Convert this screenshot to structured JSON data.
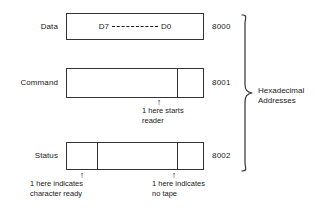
{
  "figure": {
    "rows": [
      {
        "label": "Data",
        "address": "8000",
        "bit_high": "D7",
        "bit_low": "D0",
        "separator": "dashed-line"
      },
      {
        "label": "Command",
        "address": "8001"
      },
      {
        "label": "Status",
        "address": "8002"
      }
    ],
    "annotations": [
      {
        "name": "command-start-reader",
        "arrow": "↑",
        "line1": "1 here starts",
        "line2": "reader"
      },
      {
        "name": "status-character-ready",
        "arrow": "↑",
        "line1": "1 here indicates",
        "line2": "character ready"
      },
      {
        "name": "status-no-tape",
        "arrow": "↑",
        "line1": "1 here indicates",
        "line2": "no tape"
      }
    ],
    "brace": {
      "line1": "Hexadecimal",
      "line2": "Addresses"
    },
    "colors": {
      "stroke": "#333333",
      "text": "#1a1a1a",
      "background": "#ffffff"
    }
  }
}
